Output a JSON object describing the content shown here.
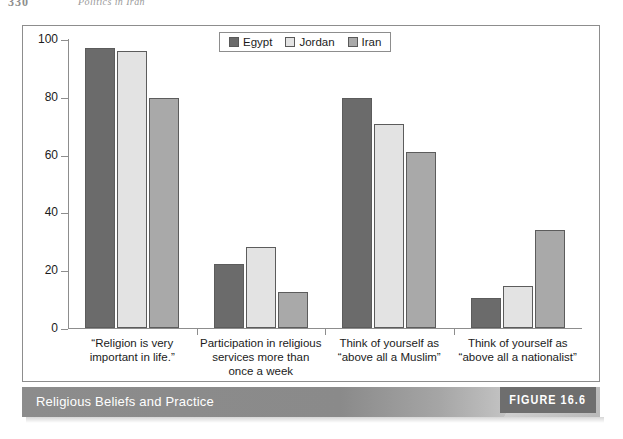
{
  "page_header": {
    "folio": "330",
    "running_head": "Politics in Iran"
  },
  "caption": {
    "title": "Religious Beliefs and Practice",
    "figure_tag": "FIGURE 16.6"
  },
  "legend": {
    "entries": [
      {
        "label": "Egypt",
        "color": "#6b6b6b"
      },
      {
        "label": "Jordan",
        "color": "#e3e3e3"
      },
      {
        "label": "Iran",
        "color": "#a9a9a9"
      }
    ]
  },
  "chart_data": {
    "type": "bar",
    "title": "Religious Beliefs and Practice",
    "xlabel": "",
    "ylabel": "",
    "ylim": [
      0,
      100
    ],
    "yticks": [
      0,
      20,
      40,
      60,
      80,
      100
    ],
    "grid": false,
    "legend_position": "top-center",
    "categories": [
      "“Religion is very important in life.”",
      "Participation in religious services more than once a week",
      "Think of yourself as “above all a Muslim”",
      "Think of yourself as “above all a nationalist”"
    ],
    "category_lines": [
      [
        "“Religion is very",
        "important in life.”"
      ],
      [
        "Participation in religious",
        "services more than",
        "once a week"
      ],
      [
        "Think of yourself as",
        "“above all a Muslim”"
      ],
      [
        "Think of yourself as",
        "“above all a nationalist”"
      ]
    ],
    "series": [
      {
        "name": "Egypt",
        "color": "#6b6b6b",
        "values": [
          97,
          22,
          79.5,
          10.5
        ]
      },
      {
        "name": "Jordan",
        "color": "#e3e3e3",
        "values": [
          96,
          28,
          70.5,
          14.5
        ]
      },
      {
        "name": "Iran",
        "color": "#a9a9a9",
        "values": [
          79.5,
          12.5,
          61,
          34
        ]
      }
    ]
  }
}
